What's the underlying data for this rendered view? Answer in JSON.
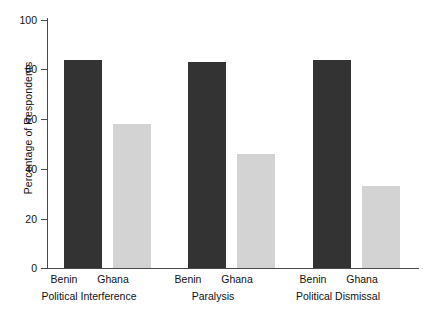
{
  "chart_data": {
    "type": "bar",
    "title": "",
    "xlabel": "",
    "ylabel": "Percentage of Respondents",
    "ylim": [
      0,
      100
    ],
    "yticks": [
      0,
      20,
      40,
      60,
      80,
      100
    ],
    "ytick_labels": [
      "0",
      "20",
      "40",
      "60",
      "80",
      "100"
    ],
    "grid": false,
    "legend": "none",
    "categories": [
      "Political Interference",
      "Paralysis",
      "Political Dismissal"
    ],
    "series": [
      {
        "name": "Benin",
        "color": "#333333",
        "values": [
          84,
          83,
          84
        ]
      },
      {
        "name": "Ghana",
        "color": "#d3d3d3",
        "values": [
          58,
          46,
          33
        ]
      }
    ],
    "bars": [
      {
        "group": "Political Interference",
        "series": "Benin",
        "value": 84,
        "color": "#333333"
      },
      {
        "group": "Political Interference",
        "series": "Ghana",
        "value": 58,
        "color": "#d3d3d3"
      },
      {
        "group": "Paralysis",
        "series": "Benin",
        "value": 83,
        "color": "#333333"
      },
      {
        "group": "Paralysis",
        "series": "Ghana",
        "value": 46,
        "color": "#d3d3d3"
      },
      {
        "group": "Political Dismissal",
        "series": "Benin",
        "value": 84,
        "color": "#333333"
      },
      {
        "group": "Political Dismissal",
        "series": "Ghana",
        "value": 33,
        "color": "#d3d3d3"
      }
    ]
  },
  "axis": {
    "y_title": "Percentage of Respondents",
    "tick_0": "0",
    "tick_20": "20",
    "tick_40": "40",
    "tick_60": "60",
    "tick_80": "80",
    "tick_100": "100"
  },
  "labels": {
    "g1_benin": "Benin",
    "g1_ghana": "Ghana",
    "g1_group": "Political Interference",
    "g2_benin": "Benin",
    "g2_ghana": "Ghana",
    "g2_group": "Paralysis",
    "g3_benin": "Benin",
    "g3_ghana": "Ghana",
    "g3_group": "Political Dismissal"
  }
}
